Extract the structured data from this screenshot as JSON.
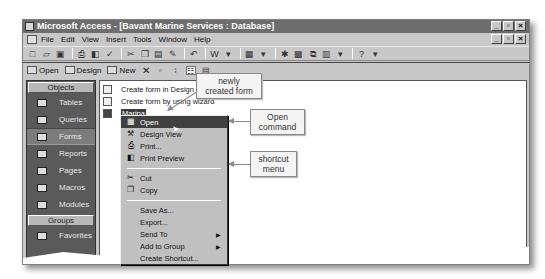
{
  "window": {
    "title": "Microsoft Access - [Bavant Marine Services : Database]",
    "controls": [
      "_",
      "▫",
      "×"
    ]
  },
  "menubar": {
    "items": [
      "File",
      "Edit",
      "View",
      "Insert",
      "Tools",
      "Window",
      "Help"
    ]
  },
  "toolbar": {
    "icons": [
      "new-icon",
      "open-icon",
      "save-icon",
      "print-icon",
      "print-preview-icon",
      "spelling-icon",
      "cut-icon",
      "copy-icon",
      "paste-icon",
      "format-painter-icon",
      "undo-icon",
      "office-links-icon",
      "analyze-icon",
      "properties-icon",
      "relationships-icon",
      "new-object-icon",
      "help-icon"
    ]
  },
  "db_toolbar": {
    "open_label": "Open",
    "design_label": "Design",
    "new_label": "New"
  },
  "objects_bar": {
    "header": "Objects",
    "items": [
      {
        "label": "Tables"
      },
      {
        "label": "Queries"
      },
      {
        "label": "Forms",
        "selected": true
      },
      {
        "label": "Reports"
      },
      {
        "label": "Pages"
      },
      {
        "label": "Macros"
      },
      {
        "label": "Modules"
      }
    ],
    "groups_header": "Groups",
    "groups": [
      {
        "label": "Favorites"
      }
    ]
  },
  "list": {
    "items": [
      {
        "label": "Create form in Design view"
      },
      {
        "label": "Create form by using wizard"
      },
      {
        "label": "Marina",
        "selected": true
      }
    ]
  },
  "context_menu": {
    "items": [
      {
        "label": "Open",
        "highlighted": true
      },
      {
        "label": "Design View"
      },
      {
        "label": "Print..."
      },
      {
        "label": "Print Preview"
      },
      {
        "label": "Cut"
      },
      {
        "label": "Copy"
      },
      {
        "label": "Save As..."
      },
      {
        "label": "Export..."
      },
      {
        "label": "Send To",
        "submenu": true
      },
      {
        "label": "Add to Group",
        "submenu": true
      },
      {
        "label": "Create Shortcut..."
      }
    ]
  },
  "callouts": {
    "newly_created": "newly\ncreated form",
    "newly_line1": "newly",
    "newly_line2": "created form",
    "open_line1": "Open",
    "open_line2": "command",
    "shortcut_line1": "shortcut",
    "shortcut_line2": "menu"
  }
}
